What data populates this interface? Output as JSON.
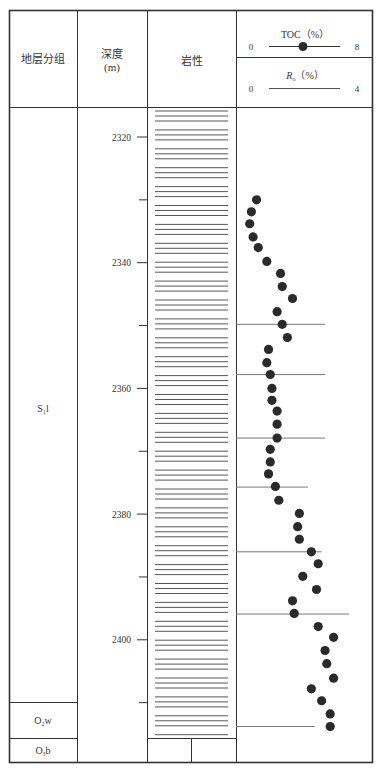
{
  "header": {
    "stratigraphy_label": "地层分组",
    "depth_label": "深度",
    "depth_unit": "(m)",
    "lithology_label": "岩性",
    "toc": {
      "label": "TOC（%）",
      "min": "0",
      "max": "8",
      "legend_symbol": "filled-circle"
    },
    "ro": {
      "label_main": "R",
      "label_sub": "o",
      "label_unit": "（%）",
      "min": "0",
      "max": "4"
    }
  },
  "formations": [
    {
      "name": "S",
      "sub": "1",
      "suffix": "l",
      "top_px": 107,
      "bottom_px": 702
    },
    {
      "name": "O",
      "sub": "2",
      "suffix": "w",
      "top_px": 702,
      "bottom_px": 738
    },
    {
      "name": "O",
      "sub": "3",
      "suffix": "b",
      "top_px": 738,
      "bottom_px": 762
    }
  ],
  "depth_axis": {
    "ticks": [
      {
        "label": "2320",
        "depth": 2320
      },
      {
        "label": "2340",
        "depth": 2340
      },
      {
        "label": "2360",
        "depth": 2360
      },
      {
        "label": "2380",
        "depth": 2380
      },
      {
        "label": "2400",
        "depth": 2400
      }
    ],
    "minor_ticks": [
      2330,
      2350,
      2370,
      2390,
      2410
    ]
  },
  "lithology": {
    "pattern": "shale-horizontal-lines",
    "color": "#444444"
  },
  "colors": {
    "frame": "#333333",
    "dot": "#2a2a2a",
    "ro_line": "#777777"
  },
  "chart_data": {
    "type": "scatter",
    "title": "",
    "xlabel": "TOC (%)",
    "ylabel": "深度 (m)",
    "xlim": [
      0,
      8
    ],
    "ylim": [
      2424,
      2292
    ],
    "series": [
      {
        "name": "TOC (%)",
        "marker": "filled-circle",
        "points": [
          {
            "depth": 2330.0,
            "toc": 1.2
          },
          {
            "depth": 2331.9,
            "toc": 0.9
          },
          {
            "depth": 2333.8,
            "toc": 0.8
          },
          {
            "depth": 2335.9,
            "toc": 1.0
          },
          {
            "depth": 2337.6,
            "toc": 1.3
          },
          {
            "depth": 2339.8,
            "toc": 1.8
          },
          {
            "depth": 2341.7,
            "toc": 2.6
          },
          {
            "depth": 2343.8,
            "toc": 2.7
          },
          {
            "depth": 2345.7,
            "toc": 3.3
          },
          {
            "depth": 2347.8,
            "toc": 2.4
          },
          {
            "depth": 2349.8,
            "toc": 2.7
          },
          {
            "depth": 2351.9,
            "toc": 3.0
          },
          {
            "depth": 2353.8,
            "toc": 1.9
          },
          {
            "depth": 2355.9,
            "toc": 1.8
          },
          {
            "depth": 2357.8,
            "toc": 2.0
          },
          {
            "depth": 2360.0,
            "toc": 2.1
          },
          {
            "depth": 2361.9,
            "toc": 2.1
          },
          {
            "depth": 2363.6,
            "toc": 2.4
          },
          {
            "depth": 2365.7,
            "toc": 2.4
          },
          {
            "depth": 2367.9,
            "toc": 2.4
          },
          {
            "depth": 2369.7,
            "toc": 2.0
          },
          {
            "depth": 2371.7,
            "toc": 2.0
          },
          {
            "depth": 2373.6,
            "toc": 1.9
          },
          {
            "depth": 2375.6,
            "toc": 2.3
          },
          {
            "depth": 2377.8,
            "toc": 2.5
          },
          {
            "depth": 2379.9,
            "toc": 3.7
          },
          {
            "depth": 2382.0,
            "toc": 3.6
          },
          {
            "depth": 2384.0,
            "toc": 3.7
          },
          {
            "depth": 2386.0,
            "toc": 4.4
          },
          {
            "depth": 2387.9,
            "toc": 4.8
          },
          {
            "depth": 2389.9,
            "toc": 3.9
          },
          {
            "depth": 2392.0,
            "toc": 4.7
          },
          {
            "depth": 2393.8,
            "toc": 3.3
          },
          {
            "depth": 2395.8,
            "toc": 3.4
          },
          {
            "depth": 2397.9,
            "toc": 4.8
          },
          {
            "depth": 2399.6,
            "toc": 5.7
          },
          {
            "depth": 2401.7,
            "toc": 5.2
          },
          {
            "depth": 2403.8,
            "toc": 5.3
          },
          {
            "depth": 2406.1,
            "toc": 5.7
          },
          {
            "depth": 2407.8,
            "toc": 4.4
          },
          {
            "depth": 2409.7,
            "toc": 5.0
          },
          {
            "depth": 2411.8,
            "toc": 5.5
          },
          {
            "depth": 2413.8,
            "toc": 5.5
          }
        ]
      },
      {
        "name": "Ro (%)",
        "marker": "horizontal-line",
        "points": [
          {
            "depth": 2349.8,
            "ro": 2.6
          },
          {
            "depth": 2357.8,
            "ro": 2.6
          },
          {
            "depth": 2367.9,
            "ro": 2.6
          },
          {
            "depth": 2375.7,
            "ro": 2.1
          },
          {
            "depth": 2386.0,
            "ro": 2.5
          },
          {
            "depth": 2395.9,
            "ro": 3.3
          },
          {
            "depth": 2413.8,
            "ro": 2.3
          }
        ]
      }
    ],
    "annotations": [
      "S1l",
      "O2w",
      "O3b"
    ],
    "grid": false,
    "legend_position": "header"
  }
}
